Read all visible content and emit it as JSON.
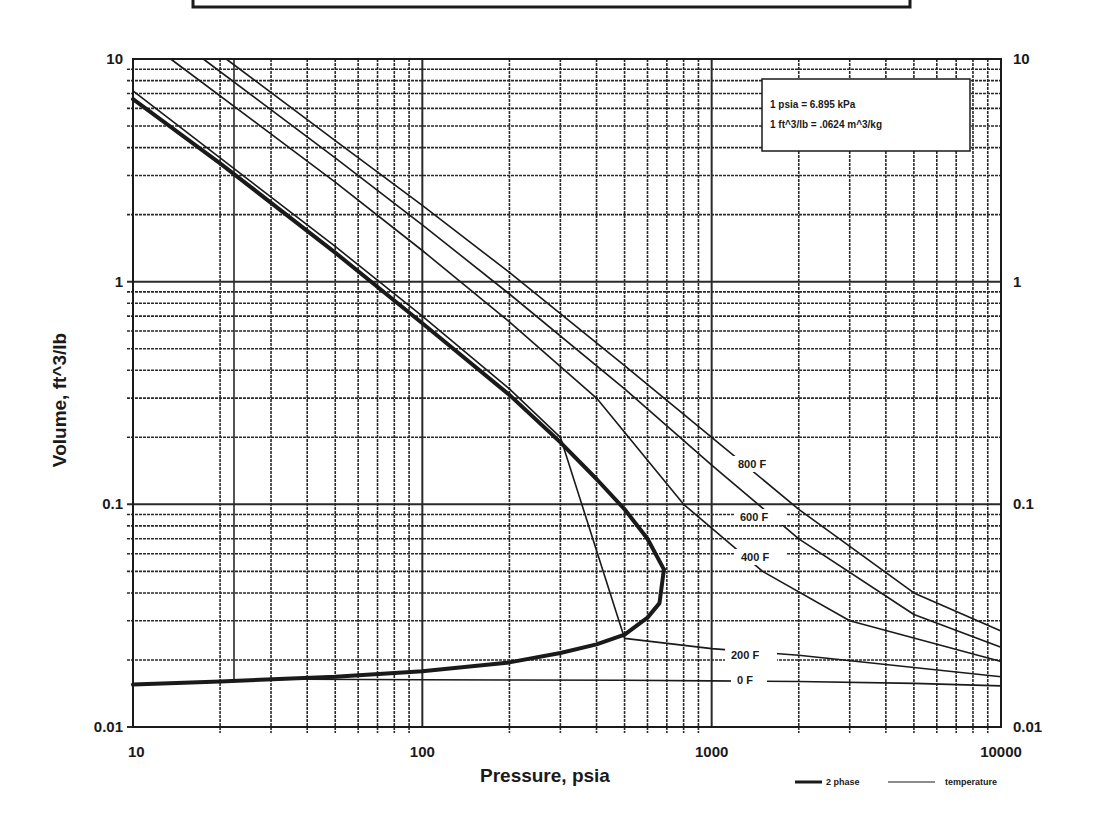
{
  "chart_data": {
    "type": "line",
    "title": "",
    "xlabel": "Pressure, psia",
    "ylabel": "Volume, ft^3/lb",
    "xscale": "log",
    "yscale": "log",
    "xlim": [
      10,
      10000
    ],
    "ylim": [
      0.01,
      10
    ],
    "x_ticks": [
      "10",
      "100",
      "1000",
      "10000"
    ],
    "y_ticks_left": [
      "10",
      "1",
      "0.1",
      "0.01"
    ],
    "y_ticks_right": [
      "10",
      "1",
      "0.1",
      "0.01"
    ],
    "grid": true,
    "note_box": [
      "1 psia = 6.895 kPa",
      "1 ft^3/lb = .0624 m^3/kg"
    ],
    "legend": [
      {
        "label": "2 phase",
        "style": "thick"
      },
      {
        "label": "temperature",
        "style": "thin"
      }
    ],
    "series": [
      {
        "name": "2 phase (vapor side)",
        "style": "thick",
        "points": [
          [
            10,
            6.6
          ],
          [
            20,
            3.4
          ],
          [
            50,
            1.35
          ],
          [
            100,
            0.65
          ],
          [
            200,
            0.31
          ],
          [
            300,
            0.19
          ],
          [
            400,
            0.13
          ],
          [
            500,
            0.095
          ],
          [
            600,
            0.07
          ],
          [
            684,
            0.051
          ]
        ]
      },
      {
        "name": "2 phase (liquid side)",
        "style": "thick",
        "points": [
          [
            684,
            0.051
          ],
          [
            660,
            0.036
          ],
          [
            600,
            0.031
          ],
          [
            500,
            0.026
          ],
          [
            400,
            0.0235
          ],
          [
            300,
            0.0215
          ],
          [
            200,
            0.0195
          ],
          [
            100,
            0.0178
          ],
          [
            50,
            0.0168
          ],
          [
            20,
            0.016
          ],
          [
            10,
            0.0155
          ]
        ]
      },
      {
        "name": "800 F",
        "label": "800 F",
        "style": "thin",
        "points": [
          [
            21,
            10
          ],
          [
            50,
            4.3
          ],
          [
            100,
            2.2
          ],
          [
            200,
            1.1
          ],
          [
            500,
            0.42
          ],
          [
            1000,
            0.2
          ],
          [
            2000,
            0.095
          ],
          [
            5000,
            0.04
          ],
          [
            10000,
            0.027
          ]
        ]
      },
      {
        "name": "600 F",
        "label": "600 F",
        "style": "thin",
        "points": [
          [
            17.5,
            10
          ],
          [
            50,
            3.6
          ],
          [
            100,
            1.8
          ],
          [
            200,
            0.88
          ],
          [
            500,
            0.33
          ],
          [
            1000,
            0.15
          ],
          [
            2000,
            0.07
          ],
          [
            5000,
            0.032
          ],
          [
            10000,
            0.0228
          ]
        ]
      },
      {
        "name": "400 F",
        "label": "400 F",
        "style": "thin",
        "points": [
          [
            13.5,
            10
          ],
          [
            50,
            2.8
          ],
          [
            100,
            1.38
          ],
          [
            200,
            0.66
          ],
          [
            400,
            0.3
          ],
          [
            800,
            0.1
          ],
          [
            1500,
            0.05
          ],
          [
            3000,
            0.03
          ],
          [
            10000,
            0.0197
          ]
        ]
      },
      {
        "name": "200 F",
        "label": "200 F",
        "style": "thin",
        "points": [
          [
            10,
            7.2
          ],
          [
            20,
            3.6
          ],
          [
            50,
            1.44
          ],
          [
            100,
            0.7
          ],
          [
            200,
            0.33
          ],
          [
            300,
            0.2
          ],
          [
            500,
            0.025
          ],
          [
            1000,
            0.0225
          ],
          [
            2000,
            0.021
          ],
          [
            5000,
            0.0185
          ],
          [
            10000,
            0.0168
          ]
        ]
      },
      {
        "name": "0 F",
        "label": "0 F",
        "style": "thin",
        "points": [
          [
            38,
            0.0164
          ],
          [
            100,
            0.0163
          ],
          [
            500,
            0.0162
          ],
          [
            1000,
            0.0161
          ],
          [
            2000,
            0.016
          ],
          [
            5000,
            0.0157
          ],
          [
            10000,
            0.0153
          ]
        ]
      }
    ]
  },
  "plot_area": {
    "left": 133,
    "right": 1001,
    "top": 59,
    "bottom": 727
  },
  "colors": {
    "ink": "#1a1a1a",
    "grid": "#2a2a2a",
    "background": "#ffffff"
  }
}
